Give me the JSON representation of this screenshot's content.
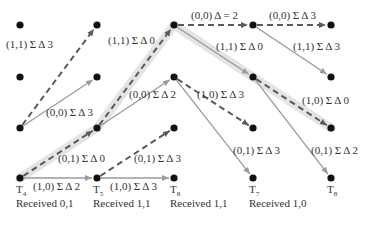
{
  "diagram": {
    "colors": {
      "node": "#111111",
      "edge_solid": "#9a9a9a",
      "edge_dashed": "#5a5a5a",
      "highlight": "#e4e4e4"
    },
    "nodes": [
      {
        "id": "c0r0",
        "x": 20,
        "y": 25
      },
      {
        "id": "c0r1",
        "x": 20,
        "y": 77
      },
      {
        "id": "c0r2",
        "x": 20,
        "y": 128
      },
      {
        "id": "c0r3",
        "x": 20,
        "y": 178
      },
      {
        "id": "c1r0",
        "x": 97,
        "y": 25
      },
      {
        "id": "c1r1",
        "x": 97,
        "y": 77
      },
      {
        "id": "c1r2",
        "x": 97,
        "y": 128
      },
      {
        "id": "c1r3",
        "x": 97,
        "y": 178
      },
      {
        "id": "c2r0",
        "x": 174,
        "y": 25
      },
      {
        "id": "c2r1",
        "x": 174,
        "y": 77
      },
      {
        "id": "c2r2",
        "x": 174,
        "y": 128
      },
      {
        "id": "c2r3",
        "x": 174,
        "y": 178
      },
      {
        "id": "c3r0",
        "x": 253,
        "y": 25
      },
      {
        "id": "c3r1",
        "x": 253,
        "y": 77
      },
      {
        "id": "c3r2",
        "x": 253,
        "y": 128
      },
      {
        "id": "c3r3",
        "x": 253,
        "y": 178
      },
      {
        "id": "c4r0",
        "x": 331,
        "y": 25
      },
      {
        "id": "c4r1",
        "x": 331,
        "y": 77
      },
      {
        "id": "c4r2",
        "x": 331,
        "y": 128
      },
      {
        "id": "c4r3",
        "x": 331,
        "y": 178
      }
    ],
    "edges": [
      {
        "from": [
          20,
          128
        ],
        "to": [
          97,
          25
        ],
        "style": "dashed",
        "highlight": false,
        "label": "(1,1) Σ Δ 3",
        "lx": 6,
        "ly": 38
      },
      {
        "from": [
          20,
          128
        ],
        "to": [
          97,
          77
        ],
        "style": "solid",
        "highlight": false,
        "label": "(0,0) Σ Δ 3",
        "lx": 46,
        "ly": 106
      },
      {
        "from": [
          20,
          178
        ],
        "to": [
          97,
          128
        ],
        "style": "dashed",
        "highlight": true,
        "label": "(0,1) Σ Δ 0",
        "lx": 58,
        "ly": 152
      },
      {
        "from": [
          20,
          178
        ],
        "to": [
          97,
          178
        ],
        "style": "solid",
        "highlight": false,
        "label": "(1,0) Σ Δ 2",
        "lx": 33,
        "ly": 180
      },
      {
        "from": [
          97,
          128
        ],
        "to": [
          174,
          25
        ],
        "style": "dashed",
        "highlight": true,
        "label": "(1,1) Σ Δ 0",
        "lx": 108,
        "ly": 34
      },
      {
        "from": [
          97,
          128
        ],
        "to": [
          174,
          77
        ],
        "style": "solid",
        "highlight": false,
        "label": "(0,0) Σ Δ 2",
        "lx": 129,
        "ly": 88
      },
      {
        "from": [
          97,
          178
        ],
        "to": [
          174,
          128
        ],
        "style": "dashed",
        "highlight": false,
        "label": "(0,1) Σ Δ 3",
        "lx": 134,
        "ly": 152
      },
      {
        "from": [
          97,
          178
        ],
        "to": [
          174,
          178
        ],
        "style": "solid",
        "highlight": false,
        "label": "(1,0) Σ Δ 3",
        "lx": 110,
        "ly": 180
      },
      {
        "from": [
          174,
          25
        ],
        "to": [
          253,
          25
        ],
        "style": "dashed",
        "highlight": false,
        "label": "(0,0) Δ = 2",
        "lx": 191,
        "ly": 9
      },
      {
        "from": [
          174,
          25
        ],
        "to": [
          253,
          77
        ],
        "style": "solid",
        "highlight": true,
        "label": "(1,1) Σ Δ 0",
        "lx": 216,
        "ly": 40
      },
      {
        "from": [
          174,
          77
        ],
        "to": [
          253,
          128
        ],
        "style": "dashed",
        "highlight": false,
        "label": "(1,0) Σ Δ 3",
        "lx": 197,
        "ly": 88
      },
      {
        "from": [
          174,
          77
        ],
        "to": [
          253,
          178
        ],
        "style": "solid",
        "highlight": false,
        "label": "(0,1) Σ Δ 3",
        "lx": 233,
        "ly": 144
      },
      {
        "from": [
          253,
          25
        ],
        "to": [
          331,
          25
        ],
        "style": "dashed",
        "highlight": false,
        "label": "(0,0) Σ Δ 3",
        "lx": 269,
        "ly": 9
      },
      {
        "from": [
          253,
          25
        ],
        "to": [
          331,
          77
        ],
        "style": "solid",
        "highlight": false,
        "label": "(1,1) Σ Δ 3",
        "lx": 293,
        "ly": 40
      },
      {
        "from": [
          253,
          77
        ],
        "to": [
          331,
          128
        ],
        "style": "dashed",
        "highlight": true,
        "label": "(1,0) Σ Δ 0",
        "lx": 302,
        "ly": 94
      },
      {
        "from": [
          253,
          77
        ],
        "to": [
          331,
          178
        ],
        "style": "solid",
        "highlight": false,
        "label": "(0,1) Σ Δ 2",
        "lx": 311,
        "ly": 144
      }
    ],
    "time_labels": [
      {
        "base": "T",
        "sub": "4",
        "x": 16,
        "y": 183
      },
      {
        "base": "T",
        "sub": "5",
        "x": 93,
        "y": 183
      },
      {
        "base": "T",
        "sub": "8",
        "x": 170,
        "y": 183
      },
      {
        "base": "T",
        "sub": "7",
        "x": 249,
        "y": 183
      },
      {
        "base": "T",
        "sub": "8",
        "x": 327,
        "y": 183
      }
    ],
    "received_labels": [
      {
        "text": "Received 0,1",
        "x": 16,
        "y": 197
      },
      {
        "text": "Received 1,1",
        "x": 93,
        "y": 197
      },
      {
        "text": "Received 1,1",
        "x": 170,
        "y": 197
      },
      {
        "text": "Received 1,0",
        "x": 249,
        "y": 197
      }
    ]
  }
}
